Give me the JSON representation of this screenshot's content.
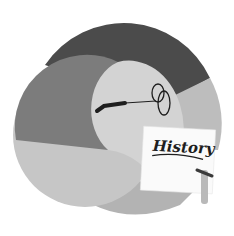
{
  "illustration": {
    "subject": "history-education-icon",
    "paper_label": "History",
    "colors": {
      "background": "#ffffff",
      "dark_band": "#4b4b4b",
      "left_disc": "#7c7c7c",
      "inner_circle": "#d3d3d3",
      "lower_disc": "#c6c6c6",
      "right_wedge": "#bdbdbd",
      "bottom_band": "#b3b3b3",
      "paper": "#fafafa",
      "ink": "#1e1e1e",
      "pencil": "#b9b9b9"
    }
  }
}
